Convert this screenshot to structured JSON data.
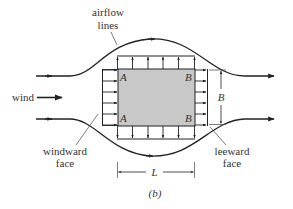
{
  "diagram": {
    "type": "wind-flow-around-building-plan-view",
    "caption": "(b)",
    "labels": {
      "airflow_line1": "airflow",
      "airflow_line2": "lines",
      "wind": "wind",
      "windward_line1": "windward",
      "windward_line2": "face",
      "leeward_line1": "leeward",
      "leeward_line2": "face",
      "corner_top_left": "A",
      "corner_bottom_left": "A",
      "corner_top_right": "B",
      "corner_bottom_right": "B",
      "dim_length": "L",
      "dim_width": "B"
    },
    "colors": {
      "building_fill": "#c8c8c8",
      "line": "#222222",
      "background": "#ffffff"
    },
    "pressure_arrows": {
      "windward_count": 6,
      "top_count": 6,
      "bottom_count": 6,
      "leeward_count": 6
    }
  }
}
